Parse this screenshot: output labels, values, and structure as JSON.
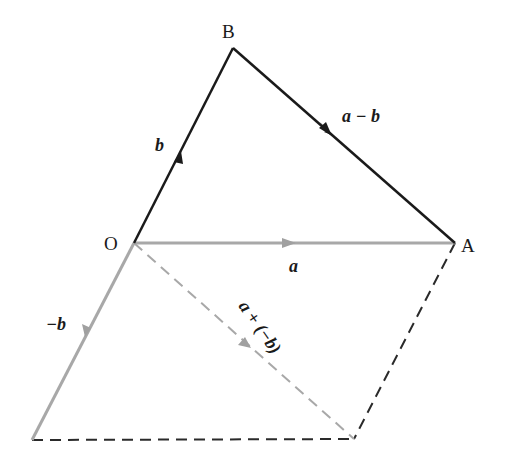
{
  "diagram": {
    "points": {
      "O": {
        "label": "O",
        "x": 134,
        "y": 243
      },
      "A": {
        "label": "A",
        "x": 455,
        "y": 243
      },
      "B": {
        "label": "B",
        "x": 233,
        "y": 48
      },
      "C": {
        "label": "",
        "x": 32,
        "y": 440
      },
      "D": {
        "label": "",
        "x": 354,
        "y": 439
      }
    },
    "vectors": [
      {
        "id": "b",
        "label": "b",
        "from": "O",
        "to": "B",
        "style": "solid",
        "color": "#1a1a1a"
      },
      {
        "id": "a_minus_b",
        "label": "a − b",
        "from": "B",
        "to": "A",
        "style": "solid",
        "color": "#1a1a1a"
      },
      {
        "id": "a",
        "label": "a",
        "from": "O",
        "to": "A",
        "style": "solid",
        "color": "#a0a0a0"
      },
      {
        "id": "neg_b",
        "label": "−b",
        "from": "O",
        "to": "C",
        "style": "solid",
        "color": "#a0a0a0"
      },
      {
        "id": "a_plus_neg_b",
        "label": "a + (−b)",
        "from": "O",
        "to": "D",
        "style": "dashed",
        "color": "#a0a0a0"
      }
    ],
    "construction_lines": [
      {
        "from": "C",
        "to": "D",
        "style": "dashed",
        "color": "#2a2a2a"
      },
      {
        "from": "A",
        "to": "D",
        "style": "dashed",
        "color": "#2a2a2a"
      }
    ],
    "labels": {
      "O": "O",
      "A": "A",
      "B": "B",
      "b": "b",
      "a": "a",
      "a_minus_b": "a − b",
      "neg_b": "−b",
      "a_plus_neg_b": "a + (−b)"
    }
  }
}
